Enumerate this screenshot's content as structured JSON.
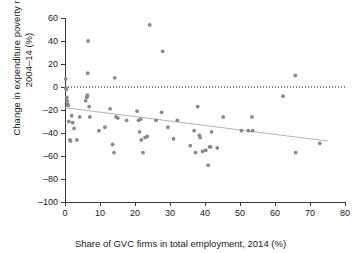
{
  "figure": {
    "title": "",
    "background_color": "#ffffff",
    "point_color": "#8a8a8a",
    "fit_line_color": "#b4b4b4",
    "zero_line_color": "#111111"
  },
  "chart_data": {
    "type": "scatter",
    "title": "",
    "xlabel": "Share of GVC firms in total employment, 2014 (%)",
    "ylabel": "Change in expenditure poverty rate,\n2004–14 (%)",
    "xlim": [
      0,
      80
    ],
    "ylim": [
      -100,
      60
    ],
    "xticks": [
      0,
      10,
      20,
      30,
      40,
      50,
      60,
      70,
      80
    ],
    "yticks": [
      60,
      40,
      20,
      0,
      -20,
      -40,
      -60,
      -80,
      -100
    ],
    "grid": false,
    "legend": null,
    "annotations": [
      {
        "type": "reference-line",
        "axis": "y",
        "value": 0,
        "style": "dotted"
      },
      {
        "type": "trend-line",
        "style": "solid",
        "x_start": 0,
        "y_start": -18,
        "x_end": 75,
        "y_end": -47
      }
    ],
    "points": [
      [
        0.2,
        7
      ],
      [
        0.3,
        -1
      ],
      [
        0.4,
        -2
      ],
      [
        0.5,
        -9
      ],
      [
        0.6,
        -12
      ],
      [
        0.8,
        -15
      ],
      [
        0.9,
        -16
      ],
      [
        1.1,
        -30
      ],
      [
        1.4,
        -46
      ],
      [
        1.6,
        -47
      ],
      [
        1.9,
        -25
      ],
      [
        2.2,
        -31
      ],
      [
        2.6,
        -36
      ],
      [
        3.4,
        -46
      ],
      [
        4.2,
        -26
      ],
      [
        5.9,
        -12
      ],
      [
        6.2,
        -9
      ],
      [
        6.3,
        -8
      ],
      [
        6.4,
        -7
      ],
      [
        6.5,
        12
      ],
      [
        6.6,
        40
      ],
      [
        6.9,
        -17
      ],
      [
        7.1,
        -26
      ],
      [
        9.7,
        -38
      ],
      [
        11.4,
        -35
      ],
      [
        12.9,
        -19
      ],
      [
        13.6,
        -50
      ],
      [
        14.0,
        -57
      ],
      [
        14.2,
        8
      ],
      [
        14.6,
        -26
      ],
      [
        15.1,
        -27
      ],
      [
        17.6,
        -29
      ],
      [
        20.6,
        -21
      ],
      [
        21.0,
        -29
      ],
      [
        21.3,
        -39
      ],
      [
        21.6,
        -28
      ],
      [
        21.8,
        -46
      ],
      [
        22.3,
        -57
      ],
      [
        22.9,
        -44
      ],
      [
        23.5,
        -43
      ],
      [
        24.2,
        54
      ],
      [
        26.0,
        -29
      ],
      [
        27.6,
        -22
      ],
      [
        27.9,
        31
      ],
      [
        29.4,
        -35
      ],
      [
        31.0,
        -45
      ],
      [
        32.1,
        -29
      ],
      [
        35.8,
        -51
      ],
      [
        36.9,
        -38
      ],
      [
        37.3,
        -57
      ],
      [
        37.9,
        -17
      ],
      [
        38.4,
        -42
      ],
      [
        38.6,
        -44
      ],
      [
        39.3,
        -56
      ],
      [
        40.2,
        -55
      ],
      [
        40.9,
        -68
      ],
      [
        41.3,
        -52
      ],
      [
        41.6,
        -52
      ],
      [
        41.9,
        -39
      ],
      [
        43.5,
        -53
      ],
      [
        45.2,
        -26
      ],
      [
        50.4,
        -38
      ],
      [
        52.4,
        -38
      ],
      [
        53.4,
        -26
      ],
      [
        53.6,
        -38
      ],
      [
        62.3,
        -8
      ],
      [
        65.8,
        10
      ],
      [
        65.9,
        -57
      ],
      [
        72.8,
        -49
      ]
    ]
  }
}
